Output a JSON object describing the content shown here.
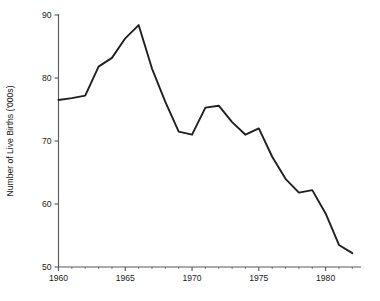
{
  "chart_data": {
    "type": "line",
    "title": "",
    "subtitle": "",
    "xlabel": "",
    "ylabel": "Number of Live Births ('000s)",
    "xlim": [
      1960,
      1982.5
    ],
    "ylim": [
      50,
      90
    ],
    "grid": false,
    "legend": null,
    "legend_position": "none",
    "line_color": "#231f20",
    "axis_color": "#555a5e",
    "x_ticks": [
      1960,
      1965,
      1970,
      1975,
      1980
    ],
    "x_tick_labels": [
      "1960",
      "1965",
      "1970",
      "1975",
      "1980"
    ],
    "x_minor_ticks": [
      1961,
      1962,
      1963,
      1964,
      1966,
      1967,
      1968,
      1969,
      1971,
      1972,
      1973,
      1974,
      1976,
      1977,
      1978,
      1979,
      1981,
      1982
    ],
    "y_ticks": [
      50,
      60,
      70,
      80,
      90
    ],
    "y_tick_labels": [
      "50",
      "60",
      "70",
      "80",
      "90"
    ],
    "x": [
      1960,
      1961,
      1962,
      1963,
      1964,
      1965,
      1966,
      1967,
      1968,
      1969,
      1970,
      1971,
      1972,
      1973,
      1974,
      1975,
      1976,
      1977,
      1978,
      1979,
      1980,
      1981,
      1982
    ],
    "values": [
      76.5,
      76.8,
      77.2,
      81.8,
      83.2,
      86.3,
      88.4,
      81.5,
      76.2,
      71.5,
      71.0,
      75.3,
      75.6,
      73.0,
      71.0,
      72.0,
      67.5,
      64.0,
      61.8,
      62.2,
      58.5,
      53.5,
      52.2
    ],
    "series": [
      {
        "name": "Live births",
        "values": [
          76.5,
          76.8,
          77.2,
          81.8,
          83.2,
          86.3,
          88.4,
          81.5,
          76.2,
          71.5,
          71.0,
          75.3,
          75.6,
          73.0,
          71.0,
          72.0,
          67.5,
          64.0,
          61.8,
          62.2,
          58.5,
          53.5,
          52.2
        ]
      }
    ]
  }
}
